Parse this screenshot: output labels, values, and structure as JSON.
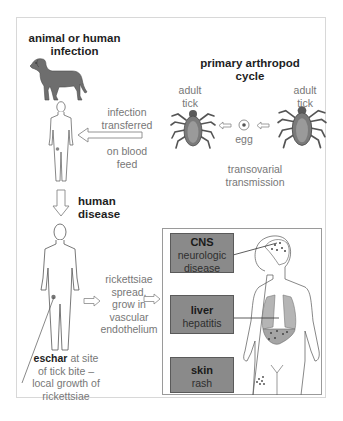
{
  "diagram": {
    "animal_infection_title": [
      "animal or human",
      "infection"
    ],
    "transfer_label_top": [
      "infection",
      "transferred"
    ],
    "transfer_label_bottom": [
      "on blood",
      "feed"
    ],
    "arthropod_title": [
      "primary arthropod",
      "cycle"
    ],
    "tick_left_label": [
      "adult",
      "tick"
    ],
    "tick_right_label": [
      "adult",
      "tick"
    ],
    "egg_label": "egg",
    "transovarial_label": [
      "transovarial",
      "transmission"
    ],
    "human_disease_title": [
      "human",
      "disease"
    ],
    "spread_label": [
      "rickettsiae",
      "spread,",
      "grow in",
      "vascular",
      "endothelium"
    ],
    "eschar_label": {
      "bold": "eschar",
      "rest": [
        "at site",
        "of tick bite –",
        "local growth of",
        "rickettsiae"
      ]
    },
    "organ_boxes": [
      {
        "title": "CNS",
        "subtitle_lines": [
          "neurologic",
          "disease"
        ]
      },
      {
        "title": "liver",
        "subtitle_lines": [
          "hepatitis"
        ]
      },
      {
        "title": "skin",
        "subtitle_lines": [
          "rash"
        ]
      }
    ],
    "colors": {
      "label_box_fill": "#8a8a8a",
      "organ_fill": "#b5b5b5",
      "figure_stroke": "#555555",
      "animal_fill": "#6e6e6e",
      "tick_fill": "#7a7a7a"
    }
  }
}
